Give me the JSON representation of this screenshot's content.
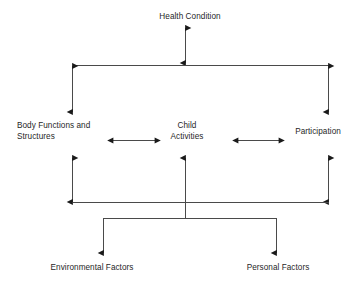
{
  "diagram": {
    "background_color": "#ffffff",
    "line_color": "#3a3a3a",
    "text_color": "#1f1f1f",
    "nodes": {
      "health_condition": "Health Condition",
      "body_functions": "Body Functions and\nStructures",
      "child_activities": "Child\nActivities",
      "participation": "Participation",
      "environmental_factors": "Environmental Factors",
      "personal_factors": "Personal Factors"
    },
    "connectors": [
      {
        "name": "health-condition-to-top-bar",
        "style": "double-headed-vertical-arrow",
        "from": "Health Condition",
        "to": "top connector bar"
      },
      {
        "name": "top-bar-to-body-functions",
        "style": "double-headed-vertical-arrow",
        "from": "top connector bar",
        "to": "Body Functions and Structures"
      },
      {
        "name": "top-bar-to-participation",
        "style": "double-headed-vertical-arrow",
        "from": "top connector bar",
        "to": "Participation"
      },
      {
        "name": "body-functions-to-child-activities",
        "style": "double-headed-horizontal-arrow",
        "from": "Body Functions and Structures",
        "to": "Child Activities"
      },
      {
        "name": "child-activities-to-participation",
        "style": "double-headed-horizontal-arrow",
        "from": "Child Activities",
        "to": "Participation"
      },
      {
        "name": "body-functions-to-bottom-bar",
        "style": "double-headed-vertical-arrow",
        "from": "Body Functions and Structures",
        "to": "bottom connector bar"
      },
      {
        "name": "participation-to-bottom-bar",
        "style": "double-headed-vertical-arrow",
        "from": "Participation",
        "to": "bottom connector bar"
      },
      {
        "name": "factors-to-child-activities",
        "style": "single-headed-up-arrow",
        "from": "Environmental and Personal Factors bar",
        "to": "Child Activities"
      },
      {
        "name": "factors-bar-to-environmental-factors",
        "style": "single-headed-down-arrow",
        "from": "factors distribution bar",
        "to": "Environmental Factors"
      },
      {
        "name": "factors-bar-to-personal-factors",
        "style": "single-headed-down-arrow",
        "from": "factors distribution bar",
        "to": "Personal Factors"
      }
    ]
  }
}
